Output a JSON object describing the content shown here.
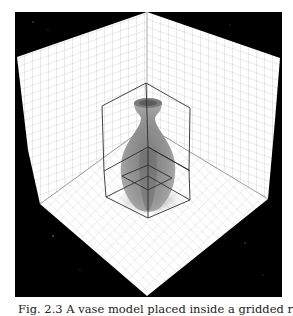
{
  "figure": {
    "background_color": "#000000",
    "wall_color": "#ffffff",
    "grid_color": "#bdbdbd",
    "vase_color": "#8a8a8a",
    "outline_color": "#333333",
    "frame": {
      "x": 15,
      "y": 12,
      "width": 267,
      "height": 285
    }
  },
  "caption": {
    "text": "Fig. 2.3  A vase model placed inside a gridded room with its bounding planes."
  }
}
